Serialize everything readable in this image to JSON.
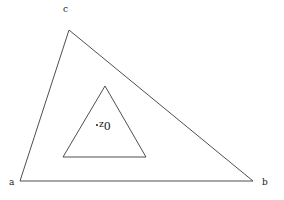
{
  "figure": {
    "title": "",
    "background_color": "#ffffff",
    "stroke_color": "#3a3a3a",
    "text_color": "#1a1a1a",
    "width": 284,
    "height": 200,
    "outer_triangle": {
      "name": "outer-triangle",
      "points": "20,181 253,181 69,30",
      "vertices": [
        {
          "id": "a",
          "label": "a",
          "x": 20,
          "y": 181
        },
        {
          "id": "b",
          "label": "b",
          "x": 253,
          "y": 181
        },
        {
          "id": "c",
          "label": "c",
          "x": 69,
          "y": 30
        }
      ]
    },
    "inner_triangle": {
      "name": "inner-triangle",
      "points": "63,157 146,157 105,86",
      "vertices": [
        {
          "x": 63,
          "y": 157
        },
        {
          "x": 146,
          "y": 157
        },
        {
          "x": 105,
          "y": 86
        }
      ]
    },
    "marked_point": {
      "id": "z0",
      "label_base": "z",
      "label_subscript": "0",
      "x": 97,
      "y": 125
    }
  },
  "labels": {
    "a": "a",
    "b": "b",
    "c": "c",
    "z0_base": "z",
    "z0_sub": "0"
  }
}
